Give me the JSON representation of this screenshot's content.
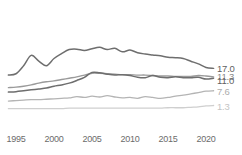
{
  "chart_data": {
    "type": "line",
    "title": "",
    "subtitle": "",
    "xlabel": "",
    "ylabel": "",
    "grid": false,
    "legend_position": "right-end-labels",
    "xlim": [
      1994,
      2021
    ],
    "ylim": [
      0,
      19
    ],
    "x_ticks": [
      1995,
      2000,
      2005,
      2010,
      2015,
      2020
    ],
    "x_tick_labels": [
      "1995",
      "2000",
      "2005",
      "2010",
      "2015",
      "2020"
    ],
    "end_labels": [
      "17.0",
      "11.3",
      "11.0",
      "7.6",
      "1.3"
    ],
    "x": [
      1994,
      1995,
      1996,
      1997,
      1998,
      1999,
      2000,
      2001,
      2002,
      2003,
      2004,
      2005,
      2006,
      2007,
      2008,
      2009,
      2010,
      2011,
      2012,
      2013,
      2014,
      2015,
      2016,
      2017,
      2018,
      2019,
      2020,
      2021
    ],
    "series": [
      {
        "name": "series-1",
        "end_value": 17.0,
        "color": "#6e6e6e",
        "width": 1.5,
        "values": [
          12.5,
          12.8,
          14.6,
          16.9,
          15.6,
          14.6,
          16.2,
          17.3,
          18.2,
          18.3,
          18.0,
          18.4,
          18.7,
          18.2,
          18.5,
          17.7,
          18.1,
          17.5,
          17.2,
          17.0,
          16.8,
          16.5,
          16.4,
          16.2,
          15.6,
          15.0,
          14.2,
          14.0
        ]
      },
      {
        "name": "series-2",
        "end_value": 11.3,
        "color": "#9a9a9a",
        "width": 1.4,
        "values": [
          9.7,
          9.8,
          10.0,
          10.3,
          10.7,
          11.0,
          11.2,
          11.5,
          11.8,
          12.1,
          12.5,
          12.9,
          12.9,
          12.8,
          12.7,
          12.6,
          12.6,
          12.5,
          12.5,
          12.4,
          12.3,
          12.3,
          12.2,
          12.2,
          12.2,
          12.4,
          12.3,
          12.1
        ]
      },
      {
        "name": "series-3",
        "end_value": 11.0,
        "color": "#6e6e6e",
        "width": 1.5,
        "values": [
          8.7,
          8.8,
          9.0,
          9.2,
          9.4,
          9.6,
          10.0,
          10.3,
          10.7,
          11.3,
          12.0,
          13.1,
          13.0,
          12.7,
          12.5,
          12.6,
          12.4,
          12.0,
          11.9,
          12.4,
          12.0,
          11.9,
          12.1,
          11.9,
          11.9,
          12.0,
          11.6,
          11.8
        ]
      },
      {
        "name": "series-4",
        "end_value": 7.6,
        "color": "#b4b4b4",
        "width": 1.3,
        "values": [
          6.7,
          6.8,
          6.9,
          7.0,
          7.0,
          7.1,
          7.2,
          7.3,
          7.4,
          7.7,
          7.5,
          7.8,
          7.6,
          7.9,
          7.6,
          7.4,
          7.5,
          7.3,
          7.7,
          7.5,
          7.3,
          7.5,
          7.8,
          8.0,
          8.3,
          8.6,
          8.9,
          9.0
        ]
      },
      {
        "name": "series-5",
        "end_value": 1.3,
        "color": "#cfcfcf",
        "width": 1.3,
        "values": [
          5.0,
          5.0,
          5.0,
          5.0,
          5.0,
          5.0,
          5.0,
          5.0,
          5.1,
          5.1,
          5.1,
          5.1,
          5.1,
          5.1,
          5.1,
          5.1,
          5.1,
          5.1,
          5.1,
          5.1,
          5.1,
          5.2,
          5.2,
          5.2,
          5.3,
          5.4,
          5.6,
          5.7
        ]
      }
    ]
  },
  "axis": {
    "label_color": "#6b6b6b",
    "end_label_colors": [
      "#5f5f5f",
      "#8a8a8a",
      "#5f5f5f",
      "#acacac",
      "#c4c4c4"
    ]
  }
}
